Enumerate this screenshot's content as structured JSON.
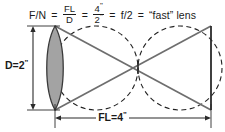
{
  "figure": {
    "formula": {
      "lead": "F/N",
      "eq1": "=",
      "fraction1": {
        "numerator": "FL",
        "denominator": "D"
      },
      "eq2": "=",
      "fraction2": {
        "numerator": "4",
        "numerator_unit": "\"",
        "denominator": "2",
        "denominator_unit": "\""
      },
      "eq3": "=",
      "result": "f/2",
      "eq4": "=",
      "conclusion": "“fast” lens"
    },
    "labels": {
      "diameter": "D=2",
      "diameter_unit": "\"",
      "focal_length": "FL=4",
      "focal_length_unit": "\""
    },
    "colors": {
      "lens_fill": "#a3a3a3",
      "stroke": "#3a3a3a",
      "dashed": "#222222",
      "text": "#1a1a1a",
      "background": "#ffffff"
    },
    "geometry": {
      "lens_center_x": 55,
      "lens_top_y": 26,
      "lens_bottom_y": 110,
      "focal_point_x": 138,
      "focal_point_y": 68,
      "image_plane_x": 211,
      "circle_radius": 42
    }
  }
}
